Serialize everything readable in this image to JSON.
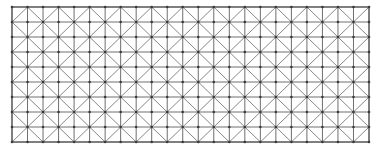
{
  "diagram": {
    "type": "lattice-grid",
    "frame": {
      "x": 12,
      "y": 7,
      "width": 357,
      "height": 135
    },
    "columns": 23,
    "rows": 9,
    "diagonal_spacing_cells": 2,
    "diagonal_offset_cells": 1,
    "node_radius": 1.3,
    "colors": {
      "background": "#ffffff",
      "grid_line": "#6e6e6e",
      "diagonal_line": "#7a7a7a",
      "node": "#3a3a3a",
      "frame_line": "#5a5a5a"
    },
    "stroke_widths": {
      "grid_line": 1.0,
      "diagonal_line": 0.9,
      "frame_line": 1.2
    }
  }
}
